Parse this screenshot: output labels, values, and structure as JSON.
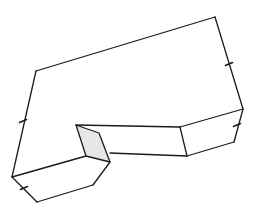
{
  "diagram": {
    "colors": {
      "line": "#1a1a1a",
      "shaded_face": "#e6e6e6",
      "background": "#ffffff"
    },
    "edges": [
      {
        "id": "top-back",
        "points": [
          [
            36,
            71
          ],
          [
            215,
            17
          ]
        ]
      },
      {
        "id": "right-upper",
        "points": [
          [
            215,
            17
          ],
          [
            243,
            109
          ]
        ]
      },
      {
        "id": "right-lower",
        "points": [
          [
            243,
            109
          ],
          [
            234,
            142
          ]
        ]
      },
      {
        "id": "right-bottom",
        "points": [
          [
            234,
            142
          ],
          [
            187,
            156
          ]
        ]
      },
      {
        "id": "right-front-top",
        "points": [
          [
            180,
            127
          ],
          [
            243,
            109
          ]
        ]
      },
      {
        "id": "inner-top",
        "points": [
          [
            76,
            125
          ],
          [
            180,
            127
          ]
        ]
      },
      {
        "id": "inner-vertical",
        "points": [
          [
            180,
            127
          ],
          [
            187,
            156
          ]
        ]
      },
      {
        "id": "inner-bottom",
        "points": [
          [
            110,
            153
          ],
          [
            187,
            156
          ]
        ]
      },
      {
        "id": "left-back",
        "points": [
          [
            36,
            71
          ],
          [
            12,
            177
          ]
        ]
      },
      {
        "id": "left-front-top",
        "points": [
          [
            12,
            177
          ],
          [
            86,
            156
          ]
        ]
      },
      {
        "id": "left-bottom-a",
        "points": [
          [
            12,
            177
          ],
          [
            37,
            202
          ]
        ]
      },
      {
        "id": "left-bottom-b",
        "points": [
          [
            37,
            202
          ],
          [
            93,
            185
          ]
        ]
      },
      {
        "id": "left-bottom-c",
        "points": [
          [
            93,
            185
          ],
          [
            110,
            162
          ]
        ]
      }
    ],
    "shaded_face": {
      "points": [
        [
          76,
          125
        ],
        [
          99,
          133
        ],
        [
          110,
          162
        ],
        [
          86,
          156
        ]
      ]
    },
    "tick_marks": [
      {
        "id": "tick-left-back",
        "at": [
          23,
          121
        ]
      },
      {
        "id": "tick-right-upper",
        "at": [
          229,
          64
        ]
      },
      {
        "id": "tick-right-lower",
        "at": [
          237,
          125
        ]
      },
      {
        "id": "tick-left-bottom",
        "at": [
          24,
          188
        ]
      }
    ]
  }
}
